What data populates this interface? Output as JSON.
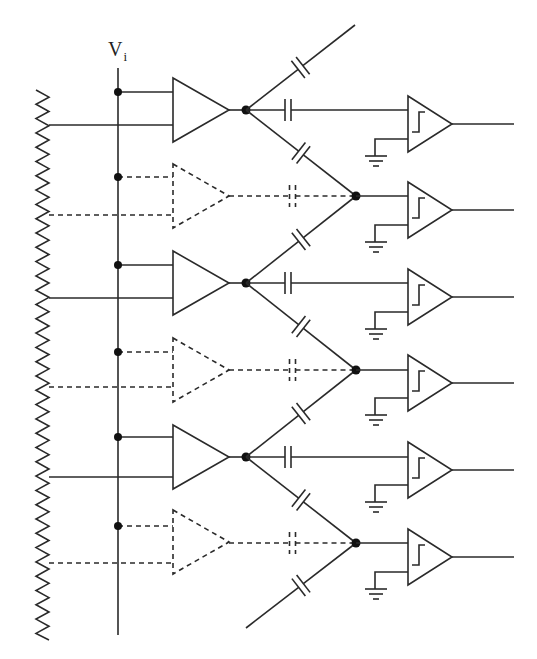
{
  "diagram": {
    "input_label": "V",
    "input_subscript": "i",
    "colors": {
      "line": "#2a2a2a",
      "node": "#111111",
      "background": "#ffffff"
    },
    "rails": {
      "resistor_ladder": {
        "x": 42,
        "y_top": 90,
        "y_bottom": 640,
        "style": "zigzag"
      },
      "input_bus": {
        "x": 118,
        "y_top": 68,
        "y_bottom": 635
      }
    },
    "preamps": [
      {
        "name": "preamp-1",
        "style": "solid",
        "y": 110,
        "tap_y": 92,
        "ref_y": 125
      },
      {
        "name": "preamp-2",
        "style": "dashed",
        "y": 196,
        "tap_y": 177,
        "ref_y": 215
      },
      {
        "name": "preamp-3",
        "style": "solid",
        "y": 283,
        "tap_y": 265,
        "ref_y": 298
      },
      {
        "name": "preamp-4",
        "style": "dashed",
        "y": 370,
        "tap_y": 352,
        "ref_y": 387
      },
      {
        "name": "preamp-5",
        "style": "solid",
        "y": 457,
        "tap_y": 437,
        "ref_y": 477
      },
      {
        "name": "preamp-6",
        "style": "dashed",
        "y": 542,
        "tap_y": 526,
        "ref_y": 563
      }
    ],
    "interpolation_nodes": [
      {
        "name": "node-1",
        "x": 356,
        "y": 196
      },
      {
        "name": "node-2",
        "x": 356,
        "y": 370
      },
      {
        "name": "node-3",
        "x": 356,
        "y": 543
      }
    ],
    "comparators": [
      {
        "name": "comparator-1",
        "y": 124,
        "type": "hysteresis"
      },
      {
        "name": "comparator-2",
        "y": 210,
        "type": "hysteresis"
      },
      {
        "name": "comparator-3",
        "y": 297,
        "type": "hysteresis"
      },
      {
        "name": "comparator-4",
        "y": 383,
        "type": "hysteresis"
      },
      {
        "name": "comparator-5",
        "y": 470,
        "type": "hysteresis"
      },
      {
        "name": "comparator-6",
        "y": 557,
        "type": "hysteresis"
      }
    ],
    "comparator_count": 6,
    "preamp_count": 6,
    "capacitor_count": 12
  }
}
